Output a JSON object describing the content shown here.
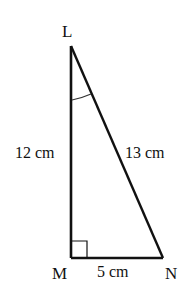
{
  "diagram": {
    "type": "right-triangle",
    "stroke_color": "#111111",
    "background": "#ffffff",
    "vertices": [
      {
        "name": "L",
        "x": 71,
        "y": 46,
        "label_x": 62,
        "label_y": 37
      },
      {
        "name": "M",
        "x": 71,
        "y": 258,
        "label_x": 52,
        "label_y": 279
      },
      {
        "name": "N",
        "x": 163,
        "y": 258,
        "label_x": 165,
        "label_y": 279
      }
    ],
    "sides": [
      {
        "from": "L",
        "to": "M",
        "label": "12 cm",
        "label_x": 15,
        "label_y": 158
      },
      {
        "from": "L",
        "to": "N",
        "label": "13 cm",
        "label_x": 125,
        "label_y": 158
      },
      {
        "from": "M",
        "to": "N",
        "label": "5 cm",
        "label_x": 97,
        "label_y": 277
      }
    ],
    "right_angle_at": "M",
    "marked_angle_at": "L"
  }
}
